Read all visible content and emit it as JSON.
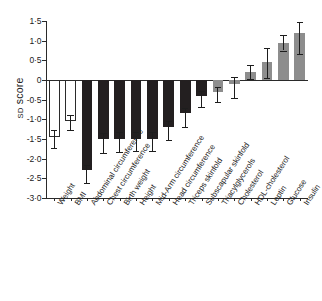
{
  "chart_data": {
    "type": "bar",
    "title": "",
    "xlabel": "",
    "ylabel": "SD score",
    "ylabel_smallcaps": "SD",
    "ylabel_rest": " score",
    "ylim": [
      -3.0,
      1.5
    ],
    "ytick_labels": [
      "1·5",
      "1·0",
      "0·5",
      "0",
      "-0·5",
      "-1·0",
      "-1·5",
      "-2·0",
      "-2·5",
      "-3·0"
    ],
    "ytick_values": [
      1.5,
      1.0,
      0.5,
      0.0,
      -0.5,
      -1.0,
      -1.5,
      -2.0,
      -2.5,
      -3.0
    ],
    "grid": false,
    "legend": "none",
    "zero_line": 0,
    "categories": [
      "Weight",
      "BMI",
      "Abdominal circumference",
      "Chest circumference",
      "Birth weight",
      "Height",
      "Mid-Arm circumference",
      "Head circumference",
      "Triceps skinfold",
      "Subscapular skinfold",
      "Triacylglycerols",
      "Cholesterol",
      "HDL-cholesterol",
      "Leptin",
      "Glucose",
      "Insulin"
    ],
    "values": [
      -1.45,
      -1.05,
      -2.3,
      -1.5,
      -1.5,
      -1.5,
      -1.5,
      -1.2,
      -0.85,
      -0.4,
      -0.3,
      -0.1,
      0.2,
      0.45,
      0.95,
      1.2
    ],
    "err_low": [
      -1.72,
      -1.27,
      -2.62,
      -1.85,
      -1.82,
      -1.8,
      -1.8,
      -1.52,
      -1.2,
      -0.68,
      -0.55,
      -0.45,
      0.02,
      0.05,
      0.75,
      0.65
    ],
    "err_high": [
      -1.28,
      -0.9,
      -2.15,
      -1.35,
      -1.33,
      -1.32,
      -1.32,
      -1.05,
      -0.72,
      -0.28,
      -0.18,
      0.08,
      0.38,
      0.82,
      1.15,
      1.48
    ],
    "bar_styles": [
      "open",
      "open",
      "black",
      "black",
      "black",
      "black",
      "black",
      "black",
      "black",
      "black",
      "gray",
      "gray",
      "gray",
      "gray",
      "gray",
      "gray"
    ],
    "colors": {
      "open_fill": "#ffffff",
      "open_edge": "#2b2b2b",
      "black_fill": "#231f20",
      "gray_fill": "#8d8d8d",
      "axis": "#2a2a2a",
      "error_bar": "#1d1d1d"
    }
  },
  "caption": {
    "text": ""
  }
}
